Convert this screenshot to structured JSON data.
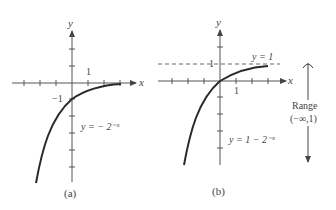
{
  "figure": {
    "panel_a": {
      "caption": "(a)",
      "axis_x_label": "x",
      "axis_y_label": "y",
      "tick_label_x": "1",
      "tick_label_y": "−1",
      "equation": "y = − 2⁻ˣ"
    },
    "panel_b": {
      "caption": "(b)",
      "axis_x_label": "x",
      "axis_y_label": "y",
      "tick_label_x": "1",
      "tick_label_y": "1",
      "asymptote_label": "y = 1",
      "equation": "y = 1 − 2⁻ˣ",
      "range_label": "Range",
      "range_value": "(−∞,1)"
    }
  },
  "colors": {
    "curve": "#2a2a2a",
    "axis": "#555555",
    "text": "#444444"
  }
}
